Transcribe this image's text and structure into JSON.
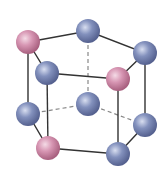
{
  "diagram": {
    "type": "hexagonal-close-packed-unit-cell",
    "colors": {
      "background": "#ffffff",
      "edge": "#333333",
      "hidden_edge": "#888888",
      "pink_atom": "#c9819f",
      "pink_atom_highlight": "#f4dbe6",
      "blue_atom": "#6f7fae",
      "blue_atom_highlight": "#d8def0"
    },
    "atoms": [
      {
        "id": "top-left",
        "x": 28,
        "y": 42,
        "r": 12,
        "color": "pink"
      },
      {
        "id": "top-back",
        "x": 88,
        "y": 31,
        "r": 12,
        "color": "blue"
      },
      {
        "id": "top-right",
        "x": 145,
        "y": 53,
        "r": 12,
        "color": "blue"
      },
      {
        "id": "top-front-left",
        "x": 47,
        "y": 73,
        "r": 12,
        "color": "blue"
      },
      {
        "id": "top-front-right",
        "x": 118,
        "y": 79,
        "r": 12,
        "color": "pink"
      },
      {
        "id": "center-back",
        "x": 88,
        "y": 104,
        "r": 12,
        "color": "blue"
      },
      {
        "id": "bottom-left",
        "x": 28,
        "y": 114,
        "r": 12,
        "color": "blue"
      },
      {
        "id": "bottom-right",
        "x": 145,
        "y": 125,
        "r": 12,
        "color": "blue"
      },
      {
        "id": "bottom-front-left",
        "x": 48,
        "y": 148,
        "r": 12,
        "color": "pink"
      },
      {
        "id": "bottom-front-right",
        "x": 118,
        "y": 154,
        "r": 12,
        "color": "blue"
      }
    ]
  }
}
